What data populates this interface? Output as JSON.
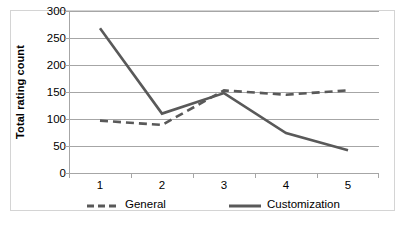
{
  "chart_data": {
    "type": "line",
    "title": "",
    "subtitle": "",
    "xlabel": "",
    "ylabel": "Total rating count",
    "categories": [
      "1",
      "2",
      "3",
      "4",
      "5"
    ],
    "x_tick_labels": [
      "1",
      "2",
      "3",
      "4",
      "5"
    ],
    "y_tick_labels": [
      "0",
      "50",
      "100",
      "150",
      "200",
      "250",
      "300"
    ],
    "y_ticks": [
      0,
      50,
      100,
      150,
      200,
      250,
      300
    ],
    "ylim": [
      0,
      300
    ],
    "grid": true,
    "legend_position": "bottom",
    "series": [
      {
        "name": "General",
        "style": "dashed",
        "color": "#595959",
        "values": [
          97,
          89,
          153,
          145,
          153
        ]
      },
      {
        "name": "Customization",
        "style": "solid",
        "color": "#595959",
        "values": [
          268,
          110,
          148,
          74,
          42
        ]
      }
    ],
    "annotations": []
  },
  "axes": {
    "y_title": "Total rating count"
  },
  "legend": {
    "entries": [
      {
        "label": "General",
        "swatch": "dashed-line-swatch"
      },
      {
        "label": "Customization",
        "swatch": "solid-line-swatch"
      }
    ]
  },
  "colors": {
    "series_line": "#595959",
    "gridline": "#a6a6a6",
    "frame_border": "#d4d4d4",
    "text": "#000000",
    "background": "#ffffff"
  }
}
